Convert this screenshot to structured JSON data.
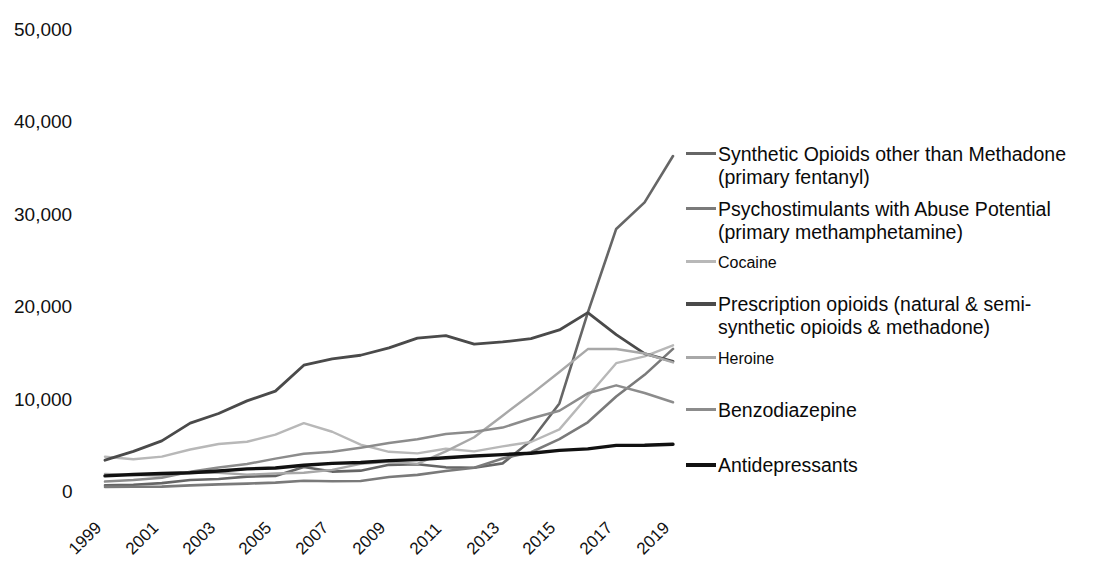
{
  "chart_data": {
    "type": "line",
    "title": "",
    "subtitle": "",
    "xlabel": "",
    "ylabel": "",
    "x": [
      1999,
      2000,
      2001,
      2002,
      2003,
      2004,
      2005,
      2006,
      2007,
      2008,
      2009,
      2010,
      2011,
      2012,
      2013,
      2014,
      2015,
      2016,
      2017,
      2018,
      2019
    ],
    "xlim": [
      1999,
      2019
    ],
    "ylim": [
      0,
      50000
    ],
    "yticks": [
      0,
      10000,
      20000,
      30000,
      40000,
      50000
    ],
    "ytick_labels": [
      "0",
      "10,000",
      "20,000",
      "30,000",
      "40,000",
      "50,000"
    ],
    "xticks": [
      1999,
      2001,
      2003,
      2005,
      2007,
      2009,
      2011,
      2013,
      2015,
      2017,
      2019
    ],
    "xtick_labels": [
      "1999",
      "2001",
      "2003",
      "2005",
      "2007",
      "2009",
      "2011",
      "2013",
      "2015",
      "2017",
      "2019"
    ],
    "xtick_rotation": -45,
    "grid": false,
    "legend_position": "right",
    "series": [
      {
        "name": "Synthetic Opioids other than Methadone\n(primary fentanyl)",
        "color": "#666666",
        "width": 2.6,
        "values": [
          730,
          780,
          960,
          1300,
          1400,
          1660,
          1740,
          2710,
          2210,
          2310,
          2940,
          3010,
          2670,
          2630,
          3100,
          5540,
          9580,
          19410,
          28470,
          31340,
          36360
        ]
      },
      {
        "name": "Psychostimulants with Abuse Potential\n(primary methamphetamine)",
        "color": "#7a7a7a",
        "width": 2.6,
        "values": [
          550,
          570,
          580,
          720,
          830,
          910,
          1020,
          1210,
          1160,
          1190,
          1630,
          1850,
          2270,
          2630,
          3630,
          4300,
          5720,
          7540,
          10330,
          12680,
          15490
        ]
      },
      {
        "name": "Cocaine",
        "color": "#b8b8b8",
        "width": 2.4,
        "values": [
          3820,
          3540,
          3830,
          4600,
          5200,
          5440,
          6210,
          7450,
          6520,
          5130,
          4350,
          4180,
          4680,
          4400,
          4940,
          5410,
          6780,
          10370,
          13940,
          14670,
          15880
        ]
      },
      {
        "name": "Prescription opioids (natural & semi-\nsynthetic opioids & methadone)",
        "color": "#4a4a4a",
        "width": 2.8,
        "values": [
          3440,
          4400,
          5530,
          7460,
          8500,
          9860,
          10920,
          13720,
          14410,
          14800,
          15600,
          16650,
          16920,
          16000,
          16240,
          16590,
          17540,
          19410,
          17030,
          14980,
          14140
        ]
      },
      {
        "name": "Heroine",
        "color": "#a8a8a8",
        "width": 2.4,
        "values": [
          1960,
          1840,
          1780,
          2090,
          2080,
          1880,
          2010,
          2090,
          2400,
          3040,
          3280,
          3040,
          4400,
          5930,
          8260,
          10570,
          12990,
          15470,
          15480,
          14990,
          14020
        ]
      },
      {
        "name": "Benzodiazepine",
        "color": "#8c8c8c",
        "width": 2.5,
        "values": [
          1130,
          1300,
          1550,
          2200,
          2650,
          3030,
          3610,
          4140,
          4350,
          4800,
          5300,
          5700,
          6270,
          6520,
          6970,
          7950,
          8790,
          10680,
          11540,
          10720,
          9710
        ]
      },
      {
        "name": "Antidepressants",
        "color": "#111111",
        "width": 3.4,
        "values": [
          1750,
          1900,
          2000,
          2080,
          2280,
          2500,
          2600,
          2900,
          3100,
          3200,
          3400,
          3500,
          3700,
          3900,
          4050,
          4200,
          4500,
          4670,
          5050,
          5060,
          5170
        ]
      }
    ]
  },
  "legend": {
    "entries": [
      {
        "label": "Synthetic Opioids other than Methadone\n(primary fentanyl)",
        "color": "#666666",
        "thickness": 3,
        "size": "normal",
        "top": 0
      },
      {
        "label": "Psychostimulants with Abuse Potential\n(primary methamphetamine)",
        "color": "#7a7a7a",
        "thickness": 3,
        "size": "normal",
        "top": 55
      },
      {
        "label": "Cocaine",
        "color": "#b8b8b8",
        "thickness": 2.5,
        "size": "small",
        "top": 110
      },
      {
        "label": "Prescription opioids (natural & semi-\nsynthetic opioids & methadone)",
        "color": "#4a4a4a",
        "thickness": 3.5,
        "size": "normal",
        "top": 150
      },
      {
        "label": "Heroine",
        "color": "#a8a8a8",
        "thickness": 2.5,
        "size": "small",
        "top": 206
      },
      {
        "label": "Benzodiazepine",
        "color": "#8c8c8c",
        "thickness": 3,
        "size": "normal",
        "top": 256
      },
      {
        "label": "Antidepressants",
        "color": "#111111",
        "thickness": 4,
        "size": "normal",
        "top": 311
      }
    ]
  }
}
